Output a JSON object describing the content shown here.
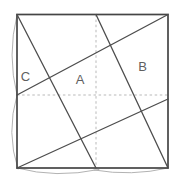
{
  "figure": {
    "canvas": {
      "width": 183,
      "height": 186
    },
    "colors": {
      "background": "#ffffff",
      "border": "#454545",
      "solid_line": "#4d4d4d",
      "dashed_line": "#b9b9b9",
      "arc": "#a9a9a9",
      "label_text": "#5f5f5f"
    },
    "square": {
      "x": 17,
      "y": 14.5,
      "width": 151,
      "height": 153.5,
      "stroke_width": 1.7
    },
    "solid_lines": [
      {
        "name": "crease-top-left-corner-to-bottom-midpoint",
        "x1": 17,
        "y1": 14.5,
        "x2": 96,
        "y2": 168
      },
      {
        "name": "crease-top-midpoint-to-bottom-right-corner",
        "x1": 96,
        "y1": 14.5,
        "x2": 168,
        "y2": 168
      },
      {
        "name": "crease-left-midpoint-to-top-right-corner",
        "x1": 17,
        "y1": 95,
        "x2": 168,
        "y2": 14.5
      },
      {
        "name": "crease-bottom-left-corner-to-right-midpoint",
        "x1": 17,
        "y1": 168,
        "x2": 168,
        "y2": 99
      }
    ],
    "solid_line_width": 1.3,
    "dashed_lines": [
      {
        "name": "vertical-midline-crease",
        "x1": 96,
        "y1": 14.5,
        "x2": 96,
        "y2": 168
      },
      {
        "name": "horizontal-midline-crease",
        "x1": 17,
        "y1": 95,
        "x2": 168,
        "y2": 95
      }
    ],
    "dash_pattern": "2.5 2.6",
    "dashed_line_width": 1,
    "arcs": [
      {
        "name": "paper-curl-left-upper",
        "d": "M 17 15 Q 7 55 17 95"
      },
      {
        "name": "paper-curl-left-lower",
        "d": "M 17 95 Q 6 133 18 169"
      },
      {
        "name": "paper-curl-bottom-left",
        "d": "M 17 168 Q 56 178.5 99 169.5"
      },
      {
        "name": "paper-curl-bottom-right",
        "d": "M 94 170 Q 132 176.5 168 168"
      }
    ],
    "arc_width": 0.9,
    "labels": [
      {
        "name": "region-label-a",
        "text": "A",
        "x": 80,
        "y": 84
      },
      {
        "name": "region-label-b",
        "text": "B",
        "x": 142.5,
        "y": 71
      },
      {
        "name": "region-label-c",
        "text": "C",
        "x": 25.5,
        "y": 81
      }
    ],
    "label_font_size": 13
  }
}
